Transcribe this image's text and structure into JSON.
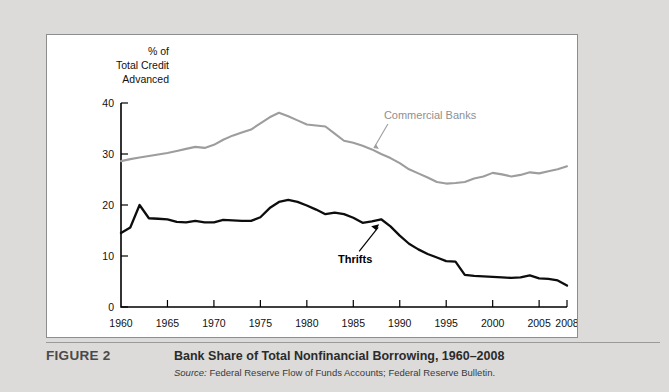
{
  "figure": {
    "number_label": "FIGURE 2",
    "title": "Bank Share of Total Nonfinancial Borrowing, 1960–2008",
    "source_word": "Source:",
    "source_text": " Federal Reserve Flow of Funds Accounts; Federal Reserve Bulletin."
  },
  "colors": {
    "page_background": "#dcdbd9",
    "panel_background": "#ffffff",
    "panel_border": "#8d8d8d",
    "commercial_banks_line": "#9d9d9d",
    "thrifts_line": "#0d0d0d",
    "axis": "#000000",
    "caption_rule": "#9a9a9a"
  },
  "chart_data": {
    "type": "line",
    "title": "Bank Share of Total Nonfinancial Borrowing, 1960–2008",
    "xlabel": "",
    "ylabel": "% of Total Credit Advanced",
    "ylabel_lines": [
      "% of",
      "Total Credit",
      "Advanced"
    ],
    "xlim": [
      1960,
      2008
    ],
    "ylim": [
      0,
      40
    ],
    "grid": false,
    "legend_position": "inline-annotations",
    "yticks": [
      0,
      10,
      20,
      30,
      40
    ],
    "ytick_labels": [
      "0",
      "10",
      "20",
      "30",
      "40"
    ],
    "xticks": [
      1960,
      1965,
      1970,
      1975,
      1980,
      1985,
      1990,
      1995,
      2000,
      2005,
      2008
    ],
    "xtick_labels": [
      "1960",
      "1965",
      "1970",
      "1975",
      "1980",
      "1985",
      "1990",
      "1995",
      "2000",
      "2005",
      "2008"
    ],
    "x": [
      1960,
      1961,
      1962,
      1963,
      1964,
      1965,
      1966,
      1967,
      1968,
      1969,
      1970,
      1971,
      1972,
      1973,
      1974,
      1975,
      1976,
      1977,
      1978,
      1979,
      1980,
      1981,
      1982,
      1983,
      1984,
      1985,
      1986,
      1987,
      1988,
      1989,
      1990,
      1991,
      1992,
      1993,
      1994,
      1995,
      1996,
      1997,
      1998,
      1999,
      2000,
      2001,
      2002,
      2003,
      2004,
      2005,
      2006,
      2007,
      2008
    ],
    "series": [
      {
        "name": "Commercial Banks",
        "color": "#9d9d9d",
        "annotation": "Commercial Banks",
        "values": [
          28.6,
          29.0,
          29.3,
          29.6,
          29.9,
          30.2,
          30.6,
          31.0,
          31.4,
          31.2,
          31.8,
          32.8,
          33.6,
          34.2,
          34.8,
          36.0,
          37.2,
          38.1,
          37.4,
          36.6,
          35.8,
          35.6,
          35.4,
          34.0,
          32.6,
          32.2,
          31.6,
          30.9,
          30.0,
          29.2,
          28.2,
          27.0,
          26.2,
          25.4,
          24.5,
          24.2,
          24.3,
          24.5,
          25.2,
          25.6,
          26.3,
          26.0,
          25.6,
          25.9,
          26.4,
          26.2,
          26.6,
          27.0,
          27.6
        ]
      },
      {
        "name": "Thrifts",
        "color": "#0d0d0d",
        "annotation": "Thrifts",
        "values": [
          14.5,
          15.6,
          20.0,
          17.4,
          17.3,
          17.2,
          16.7,
          16.6,
          16.9,
          16.6,
          16.6,
          17.1,
          17.0,
          16.9,
          16.9,
          17.6,
          19.4,
          20.6,
          21.0,
          20.6,
          19.9,
          19.1,
          18.2,
          18.5,
          18.2,
          17.5,
          16.5,
          16.8,
          17.2,
          15.8,
          14.0,
          12.4,
          11.3,
          10.4,
          9.7,
          9.0,
          8.9,
          6.3,
          6.1,
          6.0,
          5.9,
          5.8,
          5.7,
          5.8,
          6.2,
          5.6,
          5.5,
          5.2,
          4.2
        ]
      }
    ],
    "annotations": [
      {
        "text": "Commercial Banks",
        "series": "Commercial Banks",
        "points_to_year": 1987,
        "points_to_value": 30.2
      },
      {
        "text": "Thrifts",
        "series": "Thrifts",
        "points_to_year": 1988,
        "points_to_value": 17.2
      }
    ]
  }
}
